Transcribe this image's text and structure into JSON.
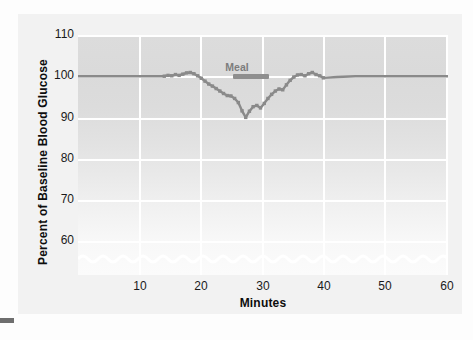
{
  "chart_data": {
    "type": "line",
    "title": "",
    "xlabel": "Minutes",
    "ylabel": "Percent of Baseline Blood Glucose",
    "xlim": [
      0,
      60
    ],
    "ylim": [
      55,
      110
    ],
    "y_axis_break": true,
    "grid": true,
    "legend": null,
    "xticks": [
      10,
      20,
      30,
      40,
      50,
      60
    ],
    "yticks": [
      60,
      70,
      80,
      90,
      100,
      110
    ],
    "annotations": [
      {
        "text": "Meal",
        "x_start": 25.3,
        "x_end": 31.2,
        "y": 99.7,
        "type": "span-bar"
      }
    ],
    "series": [
      {
        "name": "Blood glucose",
        "color": "#8a8a8a",
        "x": [
          0,
          2,
          4,
          6,
          8,
          10,
          12,
          14,
          14.6,
          15.2,
          15.8,
          16.4,
          17,
          17.6,
          18.2,
          18.8,
          19.4,
          20,
          20.6,
          21.2,
          21.8,
          22.4,
          23,
          23.6,
          24.2,
          24.8,
          25.4,
          26,
          26.6,
          27.2,
          27.8,
          28.4,
          29,
          29.6,
          30.2,
          30.8,
          31.4,
          32,
          32.6,
          33.2,
          33.8,
          34.4,
          35,
          35.6,
          36.2,
          36.8,
          37.4,
          38,
          38.6,
          39.2,
          39.8,
          42,
          45,
          48,
          51,
          54,
          57,
          60
        ],
        "y": [
          100,
          100,
          100,
          100,
          100,
          100,
          100,
          100,
          100.2,
          100.1,
          100.4,
          100.2,
          100.5,
          100.8,
          100.9,
          100.6,
          100.1,
          99.5,
          98.8,
          98.1,
          97.6,
          97.0,
          96.4,
          95.8,
          95.3,
          95.2,
          94.6,
          93.6,
          91.6,
          90.0,
          91.5,
          92.6,
          92.9,
          92.3,
          93.4,
          94.6,
          95.6,
          96.4,
          96.9,
          96.7,
          97.9,
          99.0,
          99.8,
          100.3,
          100.4,
          100.1,
          100.6,
          100.9,
          100.4,
          100.1,
          99.6,
          99.8,
          100.0,
          100.0,
          100.0,
          100.0,
          100.0,
          100.0
        ],
        "marker": "square",
        "marker_range_x": [
          14,
          40
        ]
      }
    ]
  },
  "axis": {
    "y_ticks": [
      "110",
      "100",
      "90",
      "80",
      "70",
      "60"
    ],
    "x_ticks": [
      "10",
      "20",
      "30",
      "40",
      "50",
      "60"
    ],
    "x_title": "Minutes",
    "y_title": "Percent of Baseline Blood Glucose"
  },
  "meal": {
    "label": "Meal"
  },
  "colors": {
    "line": "#8a8a8a",
    "meal_bar": "#8f8f8f",
    "meal_text": "#7d7d7d",
    "grid": "#ffffff",
    "plot_top": "#dadada",
    "plot_bottom": "#fbfbfb",
    "card": "#f2f2f2",
    "tick_text": "#1a1a1a"
  }
}
